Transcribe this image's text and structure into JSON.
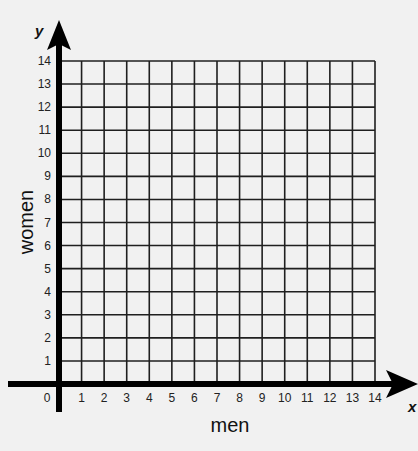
{
  "chart_data": {
    "type": "grid",
    "title": "",
    "xlabel": "men",
    "ylabel": "women",
    "x_axis_letter": "x",
    "y_axis_letter": "y",
    "xlim": [
      0,
      14
    ],
    "ylim": [
      0,
      14
    ],
    "x_ticks": [
      "0",
      "1",
      "2",
      "3",
      "4",
      "5",
      "6",
      "7",
      "8",
      "9",
      "10",
      "11",
      "12",
      "13",
      "14"
    ],
    "y_ticks": [
      "1",
      "2",
      "3",
      "4",
      "5",
      "6",
      "7",
      "8",
      "9",
      "10",
      "11",
      "12",
      "13",
      "14"
    ],
    "grid": true,
    "series": []
  },
  "colors": {
    "background": "#f1f1f1",
    "grid_line": "#1f1f1f",
    "axis": "#000000"
  }
}
